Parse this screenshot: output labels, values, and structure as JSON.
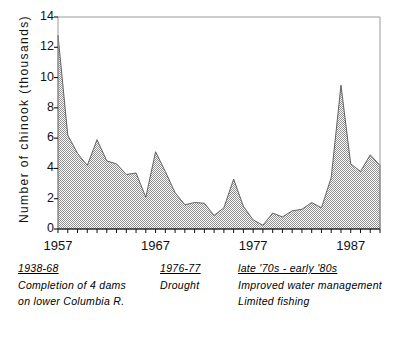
{
  "chart_data": {
    "type": "area",
    "title": "",
    "xlabel": "",
    "ylabel": "Number of chinook (thousands)",
    "xlim": [
      1957,
      1990
    ],
    "ylim": [
      0,
      14
    ],
    "grid": false,
    "legend": "none",
    "y_ticks": [
      0,
      2,
      4,
      6,
      8,
      10,
      12,
      14
    ],
    "x_ticks_labeled": [
      1957,
      1967,
      1977,
      1987
    ],
    "x_tick_interval": 1,
    "fill_pattern": "50% dither hatch",
    "fill_color": "#b0b0b0",
    "line_color": "#555555",
    "x": [
      1957,
      1958,
      1959,
      1960,
      1961,
      1962,
      1963,
      1964,
      1965,
      1966,
      1967,
      1968,
      1969,
      1970,
      1971,
      1972,
      1973,
      1974,
      1975,
      1976,
      1977,
      1978,
      1979,
      1980,
      1981,
      1982,
      1983,
      1984,
      1985,
      1986,
      1987,
      1988,
      1989,
      1990
    ],
    "values": [
      12.8,
      6.2,
      5.0,
      4.2,
      5.9,
      4.5,
      4.3,
      3.6,
      3.7,
      2.1,
      5.1,
      3.8,
      2.4,
      1.6,
      1.75,
      1.7,
      0.9,
      1.4,
      3.3,
      1.5,
      0.6,
      0.25,
      1.05,
      0.8,
      1.2,
      1.3,
      1.75,
      1.4,
      3.4,
      9.5,
      4.3,
      3.8,
      4.9,
      4.2
    ],
    "series_name": "Number of chinook (thousands)"
  },
  "axis": {
    "y_title": "Number of chinook (thousands)",
    "y_labels": [
      "14",
      "12",
      "10",
      "8",
      "6",
      "4",
      "2",
      "0"
    ],
    "x_labels": [
      "1957",
      "1967",
      "1977",
      "1987"
    ]
  },
  "notes": [
    {
      "heading": "1938-68",
      "lines": [
        "Completion of 4 dams",
        "on lower Columbia R."
      ]
    },
    {
      "heading": "1976-77",
      "lines": [
        "Drought"
      ]
    },
    {
      "heading": "late '70s - early '80s",
      "lines": [
        "Improved water management",
        "Limited fishing"
      ]
    }
  ]
}
